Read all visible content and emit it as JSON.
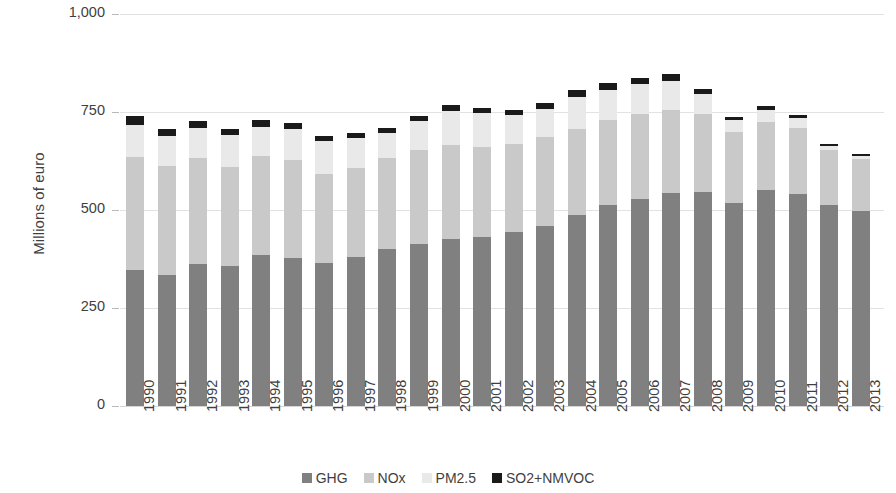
{
  "chart_data": {
    "type": "bar",
    "title": "",
    "subtitle": "",
    "xlabel": "",
    "ylabel": "Millions of euro",
    "stacked": true,
    "grid": true,
    "legend_position": "bottom",
    "ylim": [
      0,
      1000
    ],
    "yticks": [
      "0",
      "250",
      "500",
      "750",
      "1,000"
    ],
    "ytick_values": [
      0,
      250,
      500,
      750,
      1000
    ],
    "categories": [
      "1990",
      "1991",
      "1992",
      "1993",
      "1994",
      "1995",
      "1996",
      "1997",
      "1998",
      "1999",
      "2000",
      "2001",
      "2002",
      "2003",
      "2004",
      "2005",
      "2006",
      "2007",
      "2008",
      "2009",
      "2010",
      "2011",
      "2012",
      "2013"
    ],
    "series": [
      {
        "name": "GHG",
        "color": "#808080",
        "values": [
          348,
          333,
          362,
          358,
          384,
          378,
          364,
          380,
          400,
          413,
          425,
          430,
          443,
          458,
          487,
          512,
          527,
          543,
          545,
          519,
          550,
          540,
          512,
          497
        ]
      },
      {
        "name": "NOx",
        "color": "#c9c9c9",
        "values": [
          287,
          280,
          270,
          252,
          253,
          250,
          228,
          228,
          233,
          240,
          242,
          230,
          225,
          228,
          220,
          218,
          218,
          212,
          200,
          180,
          175,
          168,
          140,
          132
        ]
      },
      {
        "name": "PM2.5",
        "color": "#e9e9e9",
        "values": [
          82,
          76,
          77,
          82,
          76,
          79,
          83,
          76,
          64,
          75,
          85,
          88,
          74,
          72,
          82,
          77,
          76,
          75,
          50,
          30,
          31,
          27,
          12,
          9
        ]
      },
      {
        "name": "SO2+NMVOC",
        "color": "#1a1a1a",
        "values": [
          22,
          18,
          18,
          15,
          17,
          16,
          15,
          12,
          12,
          13,
          16,
          13,
          14,
          14,
          16,
          17,
          17,
          17,
          13,
          9,
          9,
          8,
          5,
          5
        ]
      }
    ]
  },
  "legend": {
    "items": [
      {
        "label": "GHG",
        "key": "ghg"
      },
      {
        "label": "NOx",
        "key": "nox"
      },
      {
        "label": "PM2.5",
        "key": "pm"
      },
      {
        "label": "SO2+NMVOC",
        "key": "so2"
      }
    ]
  }
}
